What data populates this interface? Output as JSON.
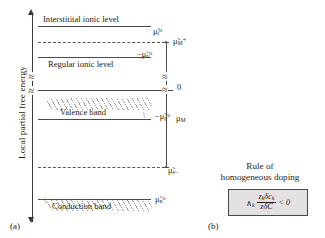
{
  "figure": {
    "axis_label": "Local partial free energy",
    "panel_a_tag": "(a)",
    "panel_b_tag": "(b)"
  },
  "levels": [
    {
      "id": "interstitial",
      "name": "Interstitital ionic level",
      "symbol_html": "μ̃<sub>i</sub><sup>o</sup>"
    },
    {
      "id": "metal-ion",
      "name": "",
      "symbol_html": "μ̃<sub>M+</sub>"
    },
    {
      "id": "regular",
      "name": "Regular ionic level",
      "symbol_html": "−μ̃<sub>v</sub><sup>o</sup>"
    },
    {
      "id": "zero",
      "name": "",
      "symbol_html": "0"
    },
    {
      "id": "valence",
      "name": "Valence band",
      "symbol_html": "−μ̃<sub>p</sub><sup>o</sup>"
    },
    {
      "id": "electron",
      "name": "",
      "symbol_html": "μ̃<sub>e−</sub>"
    },
    {
      "id": "conduction",
      "name": "Conduction band",
      "symbol_html": "μ̃<sub>n</sub><sup>o</sup>"
    }
  ],
  "brackets": [
    {
      "id": "mu-M-plus",
      "label_html": "μ̃<sub>M+</sub>"
    },
    {
      "id": "mu-M",
      "label_html": "μ<sub>M</sub>"
    }
  ],
  "labels": {
    "interstitial_level": "Interstitital ionic level",
    "regular_level": "Regular ionic level",
    "valence_band": "Valence band",
    "conduction_band": "Conduction band",
    "zero": "0"
  },
  "symbols": {
    "mu_i_0": "μ̃i°",
    "mu_M_plus": "μ̃M+",
    "mu_v_0": "−μ̃v°",
    "mu_p_0": "−μ̃p°",
    "mu_e_minus": "μ̃e−",
    "mu_n_0": "μ̃n°",
    "mu_M": "μM",
    "break_mark": "≈"
  },
  "rule": {
    "title_line1": "Rule of",
    "title_line2": "homogeneous doping",
    "formula": {
      "prefix": "∧",
      "prefix_sub": "k",
      "numerator": "z",
      "numerator_sub": "k",
      "numerator_rest": "δc",
      "numerator_rest_sub": "k",
      "denominator": "zδC",
      "comparator": "< 0"
    }
  },
  "colors": {
    "ink": "#231f20",
    "line": "#4d4a4b",
    "hatch": "#9a9798",
    "box_fill": "#e3e1e2",
    "background": "#ffffff"
  }
}
